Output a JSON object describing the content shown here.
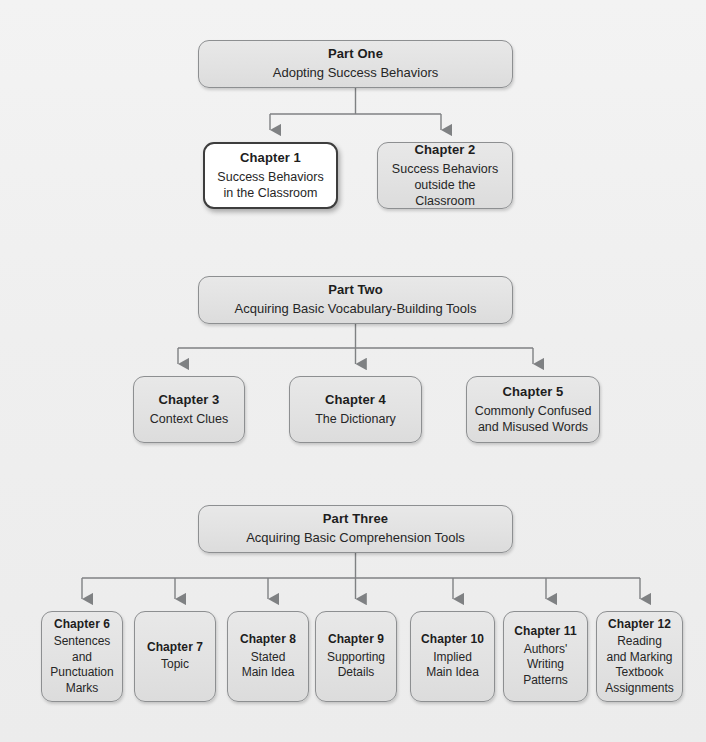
{
  "diagram": {
    "background_color": "#f1f1f1",
    "box_fill": "#e3e3e3",
    "box_border": "#8d8f91",
    "highlight_fill": "#ffffff",
    "highlight_border": "#3d3d3d",
    "connector_color": "#7f8183"
  },
  "parts": [
    {
      "id": "part-one",
      "title": "Part One",
      "subtitle": "Adopting Success Behaviors"
    },
    {
      "id": "part-two",
      "title": "Part Two",
      "subtitle": "Acquiring Basic Vocabulary-Building Tools"
    },
    {
      "id": "part-three",
      "title": "Part Three",
      "subtitle": "Acquiring Basic Comprehension Tools"
    }
  ],
  "chapters_part_one": [
    {
      "id": "chapter-1",
      "title": "Chapter 1",
      "subtitle": "Success Behaviors\nin the Classroom",
      "highlighted": true
    },
    {
      "id": "chapter-2",
      "title": "Chapter 2",
      "subtitle": "Success Behaviors\noutside the Classroom",
      "highlighted": false
    }
  ],
  "chapters_part_two": [
    {
      "id": "chapter-3",
      "title": "Chapter 3",
      "subtitle": "Context Clues",
      "highlighted": false
    },
    {
      "id": "chapter-4",
      "title": "Chapter 4",
      "subtitle": "The Dictionary",
      "highlighted": false
    },
    {
      "id": "chapter-5",
      "title": "Chapter 5",
      "subtitle": "Commonly Confused\nand Misused Words",
      "highlighted": false
    }
  ],
  "chapters_part_three": [
    {
      "id": "chapter-6",
      "title": "Chapter 6",
      "subtitle": "Sentences\nand\nPunctuation\nMarks",
      "highlighted": false
    },
    {
      "id": "chapter-7",
      "title": "Chapter 7",
      "subtitle": "Topic",
      "highlighted": false
    },
    {
      "id": "chapter-8",
      "title": "Chapter 8",
      "subtitle": "Stated\nMain Idea",
      "highlighted": false
    },
    {
      "id": "chapter-9",
      "title": "Chapter 9",
      "subtitle": "Supporting\nDetails",
      "highlighted": false
    },
    {
      "id": "chapter-10",
      "title": "Chapter 10",
      "subtitle": "Implied\nMain Idea",
      "highlighted": false
    },
    {
      "id": "chapter-11",
      "title": "Chapter 11",
      "subtitle": "Authors'\nWriting\nPatterns",
      "highlighted": false
    },
    {
      "id": "chapter-12",
      "title": "Chapter 12",
      "subtitle": "Reading\nand Marking\nTextbook\nAssignments",
      "highlighted": false
    }
  ]
}
